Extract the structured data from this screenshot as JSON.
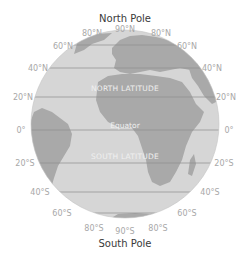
{
  "diagram": {
    "title_top": "North Pole",
    "title_bottom": "South Pole",
    "regions": {
      "north": "NORTH LATITUDE",
      "south": "SOUTH LATITUDE",
      "equator": "Equator"
    },
    "labels": {
      "n90": "90°N",
      "n80": "80°N",
      "n60": "60°N",
      "n40": "40°N",
      "n20": "20°N",
      "zero": "0°",
      "s20": "20°S",
      "s40": "40°S",
      "s60": "60°S",
      "s80": "80°S",
      "s90": "90°S"
    },
    "colors": {
      "ocean": "#d6d6d6",
      "land": "#a9a9a9",
      "line": "#8e8e8e",
      "label": "#a8a8a8",
      "pole_text": "#3a3a3a"
    }
  }
}
